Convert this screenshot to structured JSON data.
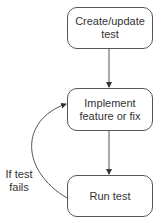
{
  "nodes": [
    {
      "id": "create",
      "lines": [
        "Create/update",
        "test"
      ]
    },
    {
      "id": "implement",
      "lines": [
        "Implement",
        "feature or fix"
      ]
    },
    {
      "id": "run",
      "lines": [
        "Run test"
      ]
    }
  ],
  "edges": [
    {
      "from": "create",
      "to": "implement"
    },
    {
      "from": "implement",
      "to": "run"
    },
    {
      "from": "run",
      "to": "implement",
      "label": [
        "If test",
        "fails"
      ]
    }
  ],
  "loop_label": {
    "line1": "If test",
    "line2": "fails"
  },
  "colors": {
    "stroke": "#555555",
    "text": "#333333",
    "background": "#ffffff"
  }
}
